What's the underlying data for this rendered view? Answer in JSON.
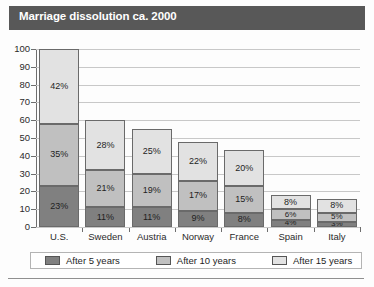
{
  "header": {
    "title": "Marriage dissolution ca. 2000"
  },
  "colors": {
    "title_band": "#585858",
    "after_5_years": "#808080",
    "after_10_years": "#c0c0c0",
    "after_15_years": "#e2e2e2",
    "gridline": "#c8c8c8",
    "axis": "#6e6e6e"
  },
  "legend": {
    "items": [
      {
        "label": "After 5 years",
        "color": "#808080"
      },
      {
        "label": "After 10 years",
        "color": "#c0c0c0"
      },
      {
        "label": "After 15 years",
        "color": "#e2e2e2"
      }
    ]
  },
  "chart_data": {
    "type": "bar",
    "stacked": true,
    "title": "Marriage dissolution ca. 2000",
    "xlabel": "",
    "ylabel": "",
    "ylim": [
      0,
      100
    ],
    "yticks": [
      0,
      10,
      20,
      30,
      40,
      50,
      60,
      70,
      80,
      90,
      100
    ],
    "grid": true,
    "legend_position": "bottom",
    "categories": [
      "U.S.",
      "Sweden",
      "Austria",
      "Norway",
      "France",
      "Spain",
      "Italy"
    ],
    "series": [
      {
        "name": "After 5 years",
        "color": "#808080",
        "values": [
          23,
          11,
          11,
          9,
          8,
          4,
          3
        ],
        "labels": [
          "23%",
          "11%",
          "11%",
          "9%",
          "8%",
          "4%",
          "3%"
        ]
      },
      {
        "name": "After 10 years",
        "color": "#c0c0c0",
        "values": [
          35,
          21,
          19,
          17,
          15,
          6,
          5
        ],
        "labels": [
          "35%",
          "21%",
          "19%",
          "17%",
          "15%",
          "6%",
          "5%"
        ]
      },
      {
        "name": "After 15 years",
        "color": "#e2e2e2",
        "values": [
          42,
          28,
          25,
          22,
          20,
          8,
          8
        ],
        "labels": [
          "42%",
          "28%",
          "25%",
          "22%",
          "20%",
          "8%",
          "8%"
        ]
      }
    ],
    "totals": [
      100,
      60,
      55,
      48,
      43,
      18,
      16
    ]
  }
}
